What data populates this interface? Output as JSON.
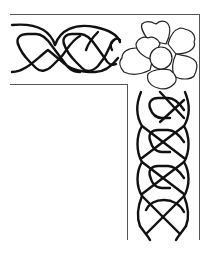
{
  "artwork": {
    "subject": "celtic-knot-corner-border-with-flower",
    "colors": {
      "background": "#ffffff",
      "frame_line": "#555555",
      "knot_stroke": "#111111",
      "flower_stroke": "#222222",
      "flower_fill": "#ffffff"
    },
    "frame": {
      "horizontal_band": {
        "left": 10,
        "top": 14,
        "right": 200,
        "bottom": 84
      },
      "vertical_band": {
        "left": 128,
        "right": 199,
        "top": 84,
        "bottom": 240
      }
    },
    "flower": {
      "cx": 163,
      "cy": 56,
      "petals": 5,
      "center_radius": 11
    }
  }
}
